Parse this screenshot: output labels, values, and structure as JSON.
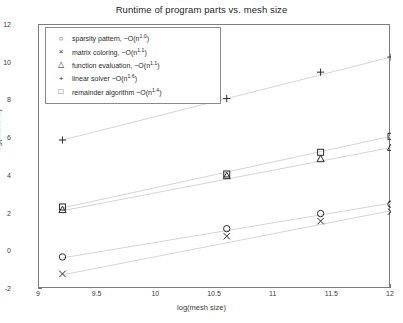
{
  "chart_data": {
    "type": "scatter",
    "title": "Runtime of program parts vs. mesh size",
    "xlabel": "log(mesh size)",
    "ylabel": "log(Runtime)",
    "xlim": [
      9,
      12
    ],
    "ylim": [
      -2,
      12
    ],
    "xticks": [
      "9",
      "9.5",
      "10",
      "10.5",
      "11",
      "11.5",
      "12"
    ],
    "xtick_values": [
      9,
      9.5,
      10,
      10.5,
      11,
      11.5,
      12
    ],
    "yticks": [
      "-2",
      "0",
      "2",
      "4",
      "6",
      "8",
      "10",
      "12"
    ],
    "ytick_values": [
      -2,
      0,
      2,
      4,
      6,
      8,
      10,
      12
    ],
    "grid": false,
    "legend_position": "upper-left",
    "x": [
      9.2,
      10.6,
      11.4,
      12.0
    ],
    "series": [
      {
        "name": "sparsity pattern",
        "complexity_base": "~O(n",
        "complexity_exponent": "1.0",
        "complexity": "~O(n^1.0)",
        "marker": "circle",
        "marker_glyph": "○",
        "values": [
          -0.3,
          1.2,
          2.0,
          2.5
        ],
        "fit_start": [
          9.2,
          -0.35
        ],
        "fit_end": [
          12.0,
          2.55
        ]
      },
      {
        "name": "matrix coloring",
        "complexity_base": "~O(n",
        "complexity_exponent": "1.1",
        "complexity": "~O(n^1.1)",
        "marker": "cross",
        "marker_glyph": "×",
        "values": [
          -1.2,
          0.8,
          1.6,
          2.1
        ],
        "fit_start": [
          9.2,
          -1.25
        ],
        "fit_end": [
          12.0,
          2.15
        ]
      },
      {
        "name": "function evaluation",
        "complexity_base": "~O(n",
        "complexity_exponent": "1.1",
        "complexity": "~O(n^1.1)",
        "marker": "triangle",
        "marker_glyph": "△",
        "values": [
          2.2,
          4.0,
          4.9,
          5.5
        ],
        "fit_start": [
          9.2,
          2.15
        ],
        "fit_end": [
          12.0,
          5.5
        ]
      },
      {
        "name": "linear solver",
        "complexity_base": "~O(n",
        "complexity_exponent": "1.6",
        "complexity": "~O(n^1.6)",
        "marker": "plus",
        "marker_glyph": "+",
        "values": [
          5.9,
          8.1,
          9.5,
          10.3
        ],
        "fit_start": [
          9.2,
          5.9
        ],
        "fit_end": [
          12.0,
          10.3
        ]
      },
      {
        "name": "remainder algorithm",
        "complexity_base": "~O(n",
        "complexity_exponent": "1.4",
        "complexity": "~O(n^1.4)",
        "marker": "square",
        "marker_glyph": "□",
        "values": [
          2.35,
          4.1,
          5.25,
          6.1
        ],
        "fit_start": [
          9.2,
          2.3
        ],
        "fit_end": [
          12.0,
          6.1
        ]
      }
    ]
  },
  "legend": {
    "items": [
      {
        "marker": "○",
        "label": "sparsity pattern, ~O(n",
        "exponent": "1.0",
        "tail": ")"
      },
      {
        "marker": "×",
        "label": "matrix coloring, ~O(n",
        "exponent": "1.1",
        "tail": ")"
      },
      {
        "marker": "△",
        "label": "function evaluation, ~O(n",
        "exponent": "1.1",
        "tail": ")"
      },
      {
        "marker": "+",
        "label": "linear solver ~O(n",
        "exponent": "1.6",
        "tail": ")"
      },
      {
        "marker": "□",
        "label": "remainder algorithm ~O(n",
        "exponent": "1.4",
        "tail": ")"
      }
    ]
  },
  "colors": {
    "marker": "#2b2b2b",
    "fit_line": "#d4d4d4",
    "axis": "#7d7d7d",
    "background": "#ffffff"
  }
}
